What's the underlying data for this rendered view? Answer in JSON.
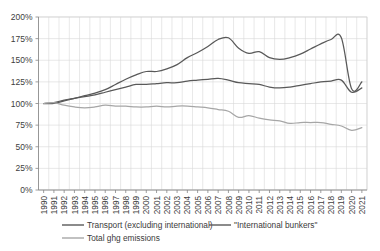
{
  "chart_data": {
    "type": "line",
    "title": "",
    "xlabel": "",
    "ylabel": "",
    "ylim": [
      0,
      200
    ],
    "yunit": "%",
    "ytick_labels": [
      "0%",
      "25%",
      "50%",
      "75%",
      "100%",
      "125%",
      "150%",
      "175%",
      "200%"
    ],
    "ytick_values": [
      0,
      25,
      50,
      75,
      100,
      125,
      150,
      175,
      200
    ],
    "grid": true,
    "legend_position": "bottom",
    "x": [
      1990,
      1991,
      1992,
      1993,
      1994,
      1995,
      1996,
      1997,
      1998,
      1999,
      2000,
      2001,
      2002,
      2003,
      2004,
      2005,
      2006,
      2007,
      2008,
      2009,
      2010,
      2011,
      2012,
      2013,
      2014,
      2015,
      2016,
      2017,
      2018,
      2019,
      2020,
      2021
    ],
    "xtick_labels": [
      "1990",
      "1991",
      "1992",
      "1993",
      "1994",
      "1995",
      "1996",
      "1997",
      "1998",
      "1999",
      "2000",
      "2001",
      "2002",
      "2003",
      "2004",
      "2005",
      "2006",
      "2007",
      "2008",
      "2009",
      "2010",
      "2011",
      "2012",
      "2013",
      "2014",
      "2015",
      "2016",
      "2017",
      "2018",
      "2019",
      "2020",
      "2021"
    ],
    "series": [
      {
        "name": "Transport (excluding international)",
        "color": "#595959",
        "values": [
          100,
          101,
          104,
          106,
          108,
          110,
          113,
          116,
          119,
          122,
          122,
          123,
          124,
          124,
          126,
          127,
          128,
          129,
          127,
          124,
          123,
          122,
          119,
          118,
          119,
          121,
          123,
          125,
          126,
          127,
          113,
          118
        ]
      },
      {
        "name": "\"International bunkers\"",
        "color": "#595959",
        "values": [
          100,
          100,
          103,
          106,
          109,
          112,
          116,
          122,
          128,
          133,
          137,
          137,
          140,
          145,
          153,
          159,
          166,
          174,
          176,
          164,
          158,
          160,
          153,
          151,
          153,
          157,
          163,
          169,
          174,
          176,
          117,
          125
        ]
      },
      {
        "name": "Total ghg emissions",
        "color": "#a6a6a6",
        "values": [
          100,
          101,
          98,
          96,
          95,
          96,
          98,
          97,
          97,
          96,
          96,
          97,
          96,
          97,
          97,
          96,
          95,
          93,
          91,
          84,
          86,
          83,
          81,
          80,
          77,
          78,
          78,
          78,
          76,
          74,
          69,
          72
        ]
      }
    ]
  },
  "legend": {
    "items": [
      {
        "label": "Transport (excluding international)"
      },
      {
        "label": "\"International bunkers\""
      },
      {
        "label": "Total ghg emissions"
      }
    ]
  }
}
